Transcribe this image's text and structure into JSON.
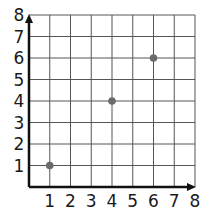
{
  "chart_data": {
    "type": "scatter",
    "title": "",
    "xlabel": "",
    "ylabel": "",
    "xlim": [
      0,
      8
    ],
    "ylim": [
      0,
      8
    ],
    "grid": true,
    "x_ticks": [
      "1",
      "2",
      "3",
      "4",
      "5",
      "6",
      "7",
      "8"
    ],
    "y_ticks": [
      "1",
      "2",
      "3",
      "4",
      "5",
      "6",
      "7",
      "8"
    ],
    "series": [
      {
        "name": "points",
        "points": [
          {
            "x": 1,
            "y": 1
          },
          {
            "x": 4,
            "y": 4
          },
          {
            "x": 6,
            "y": 6
          }
        ],
        "color": "#6b6b6b"
      }
    ]
  },
  "colors": {
    "grid": "#555555",
    "axis": "#111111",
    "point": "#6b6b6b"
  }
}
